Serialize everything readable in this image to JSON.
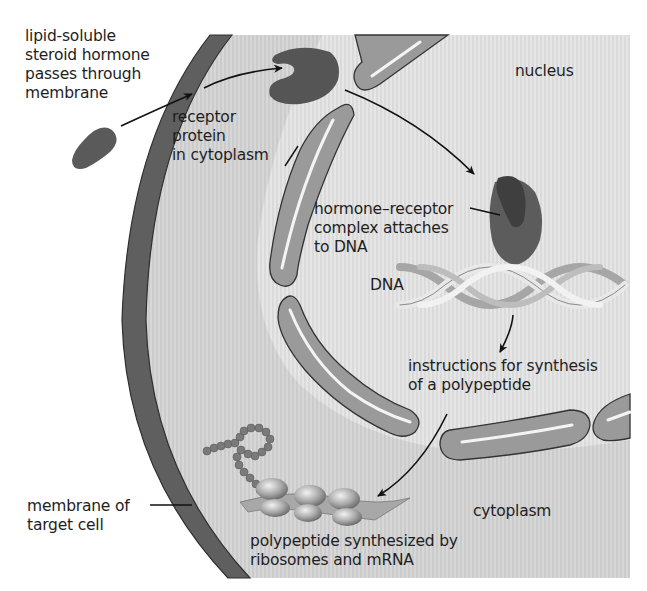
{
  "diagram": {
    "colors": {
      "background": "#ffffff",
      "cytoplasm": "#cfcfcf",
      "nucleus": "#e2e2e2",
      "cell_membrane": "#5f5f5f",
      "nuclear_envelope": "#9a9a9a",
      "envelope_outline": "#3a3a3a",
      "hormone": "#5a5a5a",
      "receptor": "#555555",
      "dna_light": "#e6e6e6",
      "dna_dark": "#a8a8a8",
      "ribosome": "#b0b0b0",
      "amino_acid": "#7a7a7a",
      "arrow": "#111111"
    },
    "labels": {
      "hormone_entry": "lipid-soluble\nsteroid hormone\npasses through\nmembrane",
      "receptor": "receptor\nprotein\nin cytoplasm",
      "nucleus": "nucleus",
      "complex": "hormone–receptor\ncomplex attaches\nto DNA",
      "dna": "DNA",
      "instructions": "instructions for synthesis\nof a polypeptide",
      "membrane": "membrane of\ntarget cell",
      "cytoplasm": "cytoplasm",
      "polypeptide": "polypeptide synthesized by\nribosomes and mRNA"
    },
    "steps": [
      {
        "from": "steroid-hormone",
        "to": "receptor-protein"
      },
      {
        "from": "receptor-protein",
        "to": "hormone-receptor-complex"
      },
      {
        "from": "dna",
        "to": "instructions"
      },
      {
        "from": "instructions",
        "to": "ribosomes"
      }
    ]
  }
}
